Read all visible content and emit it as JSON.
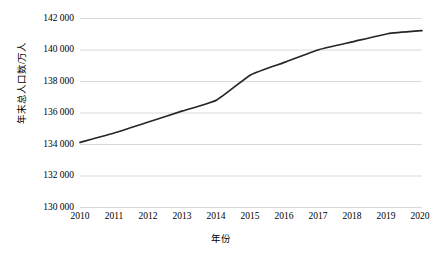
{
  "chart_data": {
    "type": "line",
    "title": "",
    "xlabel": "年份",
    "ylabel": "年末总人口数/万人",
    "categories": [
      "2010",
      "2011",
      "2012",
      "2013",
      "2014",
      "2015",
      "2016",
      "2017",
      "2018",
      "2019",
      "2020"
    ],
    "x": [
      2010,
      2011,
      2012,
      2013,
      2014,
      2015,
      2016,
      2017,
      2018,
      2019,
      2020
    ],
    "values": [
      134100,
      134700,
      135400,
      136100,
      136800,
      138400,
      139200,
      140000,
      140500,
      141000,
      141200
    ],
    "series": [
      {
        "name": "年末总人口数",
        "values": [
          134100,
          134700,
          135400,
          136100,
          136800,
          138400,
          139200,
          140000,
          140500,
          141000,
          141200
        ]
      }
    ],
    "ylim": [
      130000,
      142000
    ],
    "ytick_labels": [
      "142 000",
      "140 000",
      "138 000",
      "136 000",
      "134 000",
      "132 000",
      "130 000"
    ],
    "ytick_values": [
      142000,
      140000,
      138000,
      136000,
      134000,
      132000,
      130000
    ],
    "grid": true,
    "grid_axis": "y",
    "legend": false,
    "legend_position": "none",
    "line_color": "#262626",
    "grid_color": "#d9d9d9",
    "background_color": "#ffffff"
  }
}
